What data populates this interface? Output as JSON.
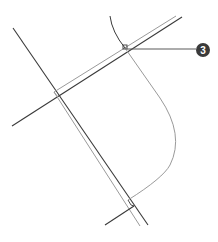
{
  "diagram": {
    "colors": {
      "background": "#ffffff",
      "dark_line": "#3a3a3a",
      "light_line": "#9a9a9a",
      "callout_fill": "#3a3a3a",
      "callout_text": "#ffffff"
    },
    "callouts": [
      {
        "label": "3"
      }
    ]
  }
}
